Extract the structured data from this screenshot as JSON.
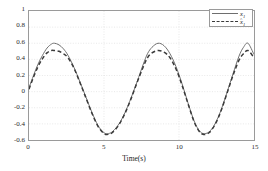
{
  "chart_data": {
    "type": "line",
    "title": "",
    "xlabel": "Time(s)",
    "ylabel": "",
    "xlim": [
      0,
      15
    ],
    "ylim": [
      -0.6,
      1
    ],
    "xticks": [
      "0",
      "5",
      "10",
      "15"
    ],
    "xtick_values": [
      0,
      5,
      10,
      15
    ],
    "yticks": [
      "1",
      "0.8",
      "0.6",
      "0.4",
      "0.2",
      "0",
      "-0.2",
      "-0.4",
      "-0.6"
    ],
    "ytick_values": [
      1,
      0.8,
      0.6,
      0.4,
      0.2,
      0,
      -0.2,
      -0.4,
      -0.6
    ],
    "grid": true,
    "legend_position": "top-right",
    "series": [
      {
        "name": "x1",
        "style": "solid",
        "color": "#6e6e6e",
        "x": [
          0,
          0.3,
          0.6,
          0.9,
          1.2,
          1.5,
          1.7,
          2.0,
          2.3,
          2.6,
          3.0,
          3.4,
          3.8,
          4.2,
          4.6,
          5.0,
          5.3,
          5.6,
          6.0,
          6.4,
          6.8,
          7.2,
          7.6,
          7.9,
          8.2,
          8.6,
          9.0,
          9.4,
          9.8,
          10.2,
          10.6,
          11.0,
          11.3,
          11.6,
          12.0,
          12.4,
          12.8,
          13.2,
          13.6,
          14.0,
          14.3,
          14.6,
          15.0
        ],
        "y": [
          0.05,
          0.2,
          0.34,
          0.45,
          0.54,
          0.59,
          0.6,
          0.58,
          0.53,
          0.45,
          0.3,
          0.12,
          -0.07,
          -0.26,
          -0.42,
          -0.51,
          -0.52,
          -0.49,
          -0.4,
          -0.26,
          -0.08,
          0.12,
          0.33,
          0.47,
          0.55,
          0.6,
          0.57,
          0.47,
          0.31,
          0.1,
          -0.14,
          -0.36,
          -0.47,
          -0.52,
          -0.5,
          -0.4,
          -0.23,
          -0.01,
          0.22,
          0.44,
          0.55,
          0.6,
          0.46
        ]
      },
      {
        "name": "x1hat",
        "style": "dashed",
        "color": "#3a3a3a",
        "x": [
          0,
          0.3,
          0.6,
          0.9,
          1.2,
          1.5,
          1.7,
          2.0,
          2.3,
          2.6,
          3.0,
          3.4,
          3.8,
          4.2,
          4.6,
          5.0,
          5.3,
          5.6,
          6.0,
          6.4,
          6.8,
          7.2,
          7.6,
          7.9,
          8.2,
          8.6,
          9.0,
          9.4,
          9.8,
          10.2,
          10.6,
          11.0,
          11.3,
          11.6,
          12.0,
          12.4,
          12.8,
          13.2,
          13.6,
          14.0,
          14.3,
          14.6,
          15.0
        ],
        "y": [
          0.03,
          0.18,
          0.31,
          0.41,
          0.48,
          0.51,
          0.51,
          0.5,
          0.47,
          0.42,
          0.29,
          0.11,
          -0.08,
          -0.27,
          -0.43,
          -0.52,
          -0.53,
          -0.5,
          -0.41,
          -0.27,
          -0.09,
          0.11,
          0.3,
          0.42,
          0.48,
          0.51,
          0.49,
          0.42,
          0.28,
          0.08,
          -0.15,
          -0.37,
          -0.48,
          -0.53,
          -0.51,
          -0.41,
          -0.24,
          -0.02,
          0.2,
          0.39,
          0.47,
          0.51,
          0.42
        ]
      }
    ]
  },
  "legend": {
    "items": [
      {
        "label_base": "x",
        "label_sub": "1",
        "hat": "",
        "style": "solid"
      },
      {
        "label_base": "x",
        "label_sub": "1",
        "hat": "^",
        "style": "dashed"
      }
    ]
  },
  "colors": {
    "series_1": "#6e6e6e",
    "series_2": "#3a3a3a",
    "grid": "#d8d8d8",
    "axis": "#9a9a9a",
    "text": "#1c1c1c",
    "background": "#ffffff"
  }
}
